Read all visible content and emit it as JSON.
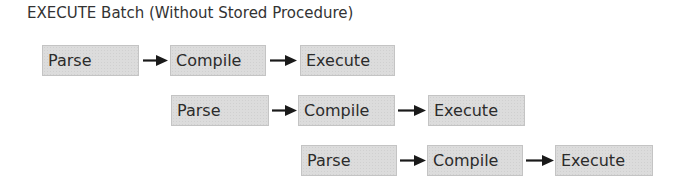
{
  "title": "EXECUTE Batch (Without Stored Procedure)",
  "rows": [
    {
      "steps": [
        {
          "label": "Parse"
        },
        {
          "label": "Compile"
        },
        {
          "label": "Execute"
        }
      ]
    },
    {
      "steps": [
        {
          "label": "Parse"
        },
        {
          "label": "Compile"
        },
        {
          "label": "Execute"
        }
      ]
    },
    {
      "steps": [
        {
          "label": "Parse"
        },
        {
          "label": "Compile"
        },
        {
          "label": "Execute"
        }
      ]
    }
  ],
  "colors": {
    "box_fill": "#dcdcdc",
    "box_border": "#c4c4c4",
    "arrow": "#1a1a1a",
    "text": "#2b2b2b"
  }
}
